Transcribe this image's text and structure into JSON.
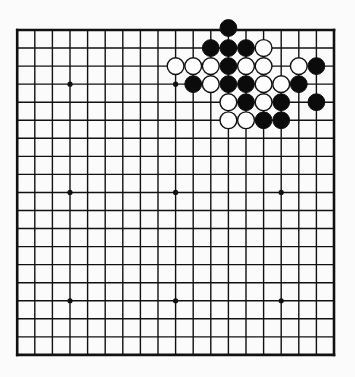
{
  "board": {
    "size": 19,
    "origin_x": 17.2,
    "origin_y": 30,
    "spacing_x": 17.6,
    "spacing_y": 18.05,
    "line_color": "#111111",
    "background": "#fbfbfb",
    "star_points": [
      [
        3,
        3
      ],
      [
        3,
        9
      ],
      [
        3,
        15
      ],
      [
        9,
        3
      ],
      [
        9,
        9
      ],
      [
        9,
        15
      ],
      [
        15,
        3
      ],
      [
        15,
        9
      ],
      [
        15,
        15
      ]
    ],
    "stones": [
      {
        "color": "black",
        "col": 12,
        "row": 0
      },
      {
        "color": "black",
        "col": 11,
        "row": 1
      },
      {
        "color": "black",
        "col": 12,
        "row": 1
      },
      {
        "color": "black",
        "col": 13,
        "row": 1
      },
      {
        "color": "white",
        "col": 14,
        "row": 1
      },
      {
        "color": "white",
        "col": 9,
        "row": 2
      },
      {
        "color": "white",
        "col": 10,
        "row": 2
      },
      {
        "color": "white",
        "col": 11,
        "row": 2
      },
      {
        "color": "black",
        "col": 12,
        "row": 2
      },
      {
        "color": "white",
        "col": 13,
        "row": 2
      },
      {
        "color": "white",
        "col": 14,
        "row": 2
      },
      {
        "color": "white",
        "col": 16,
        "row": 2
      },
      {
        "color": "black",
        "col": 17,
        "row": 2
      },
      {
        "color": "black",
        "col": 10,
        "row": 3
      },
      {
        "color": "white",
        "col": 11,
        "row": 3
      },
      {
        "color": "black",
        "col": 12,
        "row": 3
      },
      {
        "color": "black",
        "col": 13,
        "row": 3
      },
      {
        "color": "white",
        "col": 14,
        "row": 3
      },
      {
        "color": "white",
        "col": 15,
        "row": 3
      },
      {
        "color": "black",
        "col": 16,
        "row": 3
      },
      {
        "color": "white",
        "col": 12,
        "row": 4
      },
      {
        "color": "black",
        "col": 13,
        "row": 4
      },
      {
        "color": "white",
        "col": 14,
        "row": 4
      },
      {
        "color": "black",
        "col": 15,
        "row": 4
      },
      {
        "color": "black",
        "col": 17,
        "row": 4
      },
      {
        "color": "white",
        "col": 12,
        "row": 5
      },
      {
        "color": "white",
        "col": 13,
        "row": 5
      },
      {
        "color": "black",
        "col": 14,
        "row": 5
      },
      {
        "color": "black",
        "col": 15,
        "row": 5
      }
    ]
  }
}
